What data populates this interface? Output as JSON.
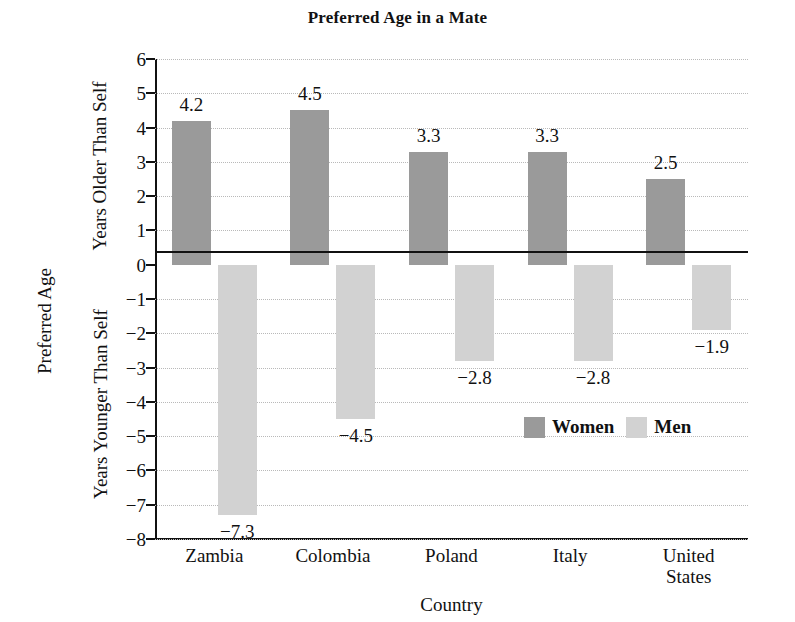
{
  "chart_data": {
    "type": "bar",
    "title": "Preferred Age in a Mate",
    "xlabel": "Country",
    "ylabel": "Preferred Age",
    "ylabel_upper": "Years Older Than Self",
    "ylabel_lower": "Years Younger Than Self",
    "categories": [
      "Zambia",
      "Colombia",
      "Poland",
      "Italy",
      "United\nStates"
    ],
    "category_lines": [
      [
        "Zambia"
      ],
      [
        "Colombia"
      ],
      [
        "Poland"
      ],
      [
        "Italy"
      ],
      [
        "United",
        "States"
      ]
    ],
    "series": [
      {
        "name": "Women",
        "color": "#9a9a9a",
        "values": [
          4.2,
          4.5,
          3.3,
          3.3,
          2.5
        ],
        "labels": [
          "4.2",
          "4.5",
          "3.3",
          "3.3",
          "2.5"
        ]
      },
      {
        "name": "Men",
        "color": "#d2d2d2",
        "values": [
          -7.3,
          -4.5,
          -2.8,
          -2.8,
          -1.9
        ],
        "labels": [
          "−7.3",
          "−4.5",
          "−2.8",
          "−2.8",
          "−1.9"
        ]
      }
    ],
    "ylim": [
      -8,
      6
    ],
    "yticks": [
      6,
      5,
      4,
      3,
      2,
      1,
      0,
      -1,
      -2,
      -3,
      -4,
      -5,
      -6,
      -7,
      -8
    ],
    "ytick_labels": [
      "6",
      "5",
      "4",
      "3",
      "2",
      "1",
      "0",
      "−1",
      "−2",
      "−3",
      "−4",
      "−5",
      "−6",
      "−7",
      "−8"
    ],
    "grid": true,
    "grid_style": "dotted",
    "grid_color": "#b9b9b9",
    "legend_position": "inside-lower-right",
    "zero_line": true,
    "background": "#ffffff"
  },
  "legend": {
    "items": [
      {
        "label": "Women",
        "color": "#9a9a9a"
      },
      {
        "label": "Men",
        "color": "#d2d2d2"
      }
    ]
  }
}
